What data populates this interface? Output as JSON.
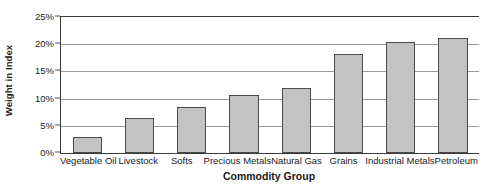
{
  "chart_data": {
    "type": "bar",
    "title": "",
    "xlabel": "Commodity Group",
    "ylabel": "Weight in Index",
    "categories": [
      "Vegetable Oil",
      "Livestock",
      "Softs",
      "Precious Metals",
      "Natural Gas",
      "Grains",
      "Industrial Metals",
      "Petroleum"
    ],
    "values": [
      3,
      6.5,
      8.4,
      10.7,
      11.9,
      18.2,
      20.4,
      21.1
    ],
    "value_unit": "%",
    "ylim": [
      0,
      25
    ],
    "ytick_values": [
      0,
      5,
      10,
      15,
      20,
      25
    ],
    "ytick_labels": [
      "0%",
      "5%",
      "10%",
      "15%",
      "20%",
      "25%"
    ],
    "grid": true,
    "legend": false,
    "bar_fill_color": "#c3c3c3",
    "bar_border_color": "#4a4a4a",
    "gridline_color": "#9a9a9a",
    "axis_color": "#3b3b3b"
  }
}
